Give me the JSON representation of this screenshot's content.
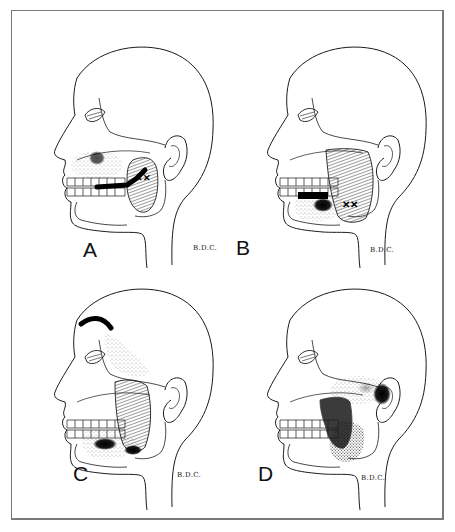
{
  "figure": {
    "type": "medical-illustration",
    "colors": {
      "line": "#1a1a1a",
      "frame": "#7a7a7a",
      "background": "#ffffff",
      "pain_zone": "#111111"
    }
  },
  "panels": [
    {
      "id": "A",
      "label": "A",
      "signature": "B.D.C.",
      "muscle": "masseter (superficial, upper portion)",
      "referral": "upper molars, maxilla, cheek"
    },
    {
      "id": "B",
      "label": "B",
      "signature": "B.D.C.",
      "muscle": "masseter (superficial, mid belly)",
      "referral": "lower molars, mandible"
    },
    {
      "id": "C",
      "label": "C",
      "signature": "B.D.C.",
      "muscle": "masseter (superficial, lower portion)",
      "referral": "eyebrow, temple, angle of mandible"
    },
    {
      "id": "D",
      "label": "D",
      "signature": "B.D.C.",
      "muscle": "masseter (deep layer)",
      "referral": "ear, TMJ region"
    }
  ]
}
